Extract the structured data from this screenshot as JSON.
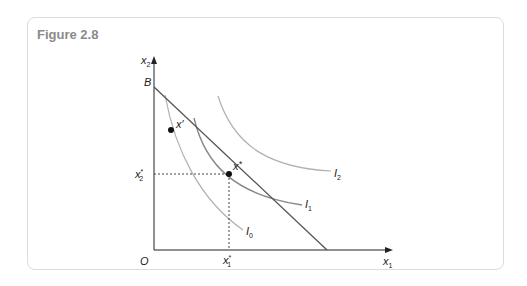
{
  "figure": {
    "title": "Figure 2.8"
  },
  "diagram": {
    "axes": {
      "x_label": "x",
      "x_sub": "1",
      "y_label": "x",
      "y_sub": "2",
      "origin": "O"
    },
    "budget_line": {
      "label": "B"
    },
    "points": [
      {
        "name": "x'",
        "label": "x",
        "mark": "′"
      },
      {
        "name": "x*",
        "label": "x",
        "mark": "*"
      }
    ],
    "tick_labels": {
      "x_star_1": {
        "base": "x",
        "sup": "*",
        "sub": "1"
      },
      "x_star_2": {
        "base": "x",
        "sup": "*",
        "sub": "2"
      }
    },
    "indifference_curves": [
      {
        "label": "I",
        "sub": "0"
      },
      {
        "label": "I",
        "sub": "1"
      },
      {
        "label": "I",
        "sub": "2"
      }
    ]
  }
}
